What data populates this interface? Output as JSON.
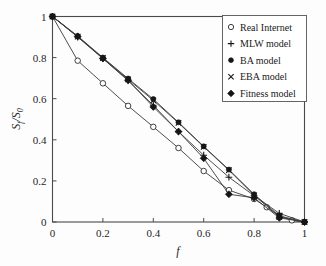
{
  "chart_data": {
    "type": "line",
    "title": "",
    "xlabel": "f",
    "ylabel": "S_f/S_0",
    "ylabel_main": "S",
    "ylabel_sub1": "f",
    "ylabel_sep": "/S",
    "ylabel_sub2": "0",
    "xlim": [
      0,
      1
    ],
    "ylim": [
      0,
      1
    ],
    "grid": false,
    "legend_position": "top-right",
    "xticks": [
      0,
      0.2,
      0.4,
      0.6,
      0.8,
      1
    ],
    "xtick_labels": [
      "0",
      "0.2",
      "0.4",
      "0.6",
      "0.8",
      "1"
    ],
    "yticks": [
      0,
      0.2,
      0.4,
      0.6,
      0.8,
      1
    ],
    "ytick_labels": [
      "0",
      "0.2",
      "0.4",
      "0.6",
      "0.8",
      "1"
    ],
    "series": [
      {
        "name": "Real Internet",
        "marker": "open-circle",
        "x": [
          0,
          0.1,
          0.2,
          0.3,
          0.4,
          0.5,
          0.6,
          0.7,
          0.8,
          0.85,
          0.9,
          0.95,
          1
        ],
        "values": [
          1,
          0.785,
          0.675,
          0.565,
          0.463,
          0.36,
          0.248,
          0.155,
          0.112,
          0.072,
          0.03,
          0.008,
          0
        ]
      },
      {
        "name": "MLW model",
        "marker": "plus",
        "x": [
          0,
          0.1,
          0.2,
          0.3,
          0.4,
          0.5,
          0.6,
          0.7,
          0.8,
          0.9,
          1
        ],
        "values": [
          1,
          0.9,
          0.795,
          0.688,
          0.568,
          0.44,
          0.325,
          0.218,
          0.128,
          0.042,
          0
        ]
      },
      {
        "name": "BA model",
        "marker": "filled-circle",
        "x": [
          0,
          0.1,
          0.2,
          0.3,
          0.4,
          0.5,
          0.6,
          0.7,
          0.8,
          0.9,
          1
        ],
        "values": [
          1,
          0.905,
          0.8,
          0.698,
          0.598,
          0.485,
          0.368,
          0.255,
          0.135,
          0.03,
          0
        ]
      },
      {
        "name": "EBA model",
        "marker": "cross",
        "x": [
          0,
          0.1,
          0.2,
          0.3,
          0.4,
          0.5,
          0.6,
          0.7,
          0.8,
          0.9,
          1
        ],
        "values": [
          1,
          0.902,
          0.798,
          0.694,
          0.592,
          0.482,
          0.366,
          0.252,
          0.13,
          0.025,
          0
        ]
      },
      {
        "name": "Fitness model",
        "marker": "filled-diamond",
        "x": [
          0,
          0.1,
          0.2,
          0.3,
          0.4,
          0.5,
          0.6,
          0.7,
          0.8,
          0.9,
          1
        ],
        "values": [
          1,
          0.903,
          0.796,
          0.69,
          0.56,
          0.44,
          0.31,
          0.135,
          0.118,
          0.02,
          0
        ]
      }
    ]
  },
  "legend": {
    "items": [
      {
        "label": "Real Internet",
        "marker": "open-circle"
      },
      {
        "label": "MLW model",
        "marker": "plus"
      },
      {
        "label": "BA model",
        "marker": "filled-circle"
      },
      {
        "label": "EBA model",
        "marker": "cross"
      },
      {
        "label": "Fitness model",
        "marker": "filled-diamond"
      }
    ]
  }
}
